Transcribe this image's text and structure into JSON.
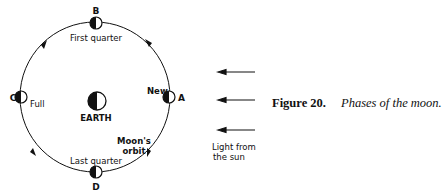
{
  "diagram": {
    "orbit_label_line1": "Moon's",
    "orbit_label_line2": "orbit",
    "earth_label": "EARTH",
    "positions": {
      "A": {
        "letter": "A",
        "phase": "New"
      },
      "B": {
        "letter": "B",
        "phase": "First quarter"
      },
      "C": {
        "letter": "C",
        "phase": "Full"
      },
      "D": {
        "letter": "D",
        "phase": "Last quarter"
      }
    },
    "sun_label_line1": "Light from",
    "sun_label_line2": "the sun",
    "orbit_direction": "counter-clockwise",
    "colors": {
      "ink": "#111111",
      "background": "#ffffff"
    }
  },
  "caption": {
    "figure": "Figure 20.",
    "title": "Phases of the moon."
  }
}
